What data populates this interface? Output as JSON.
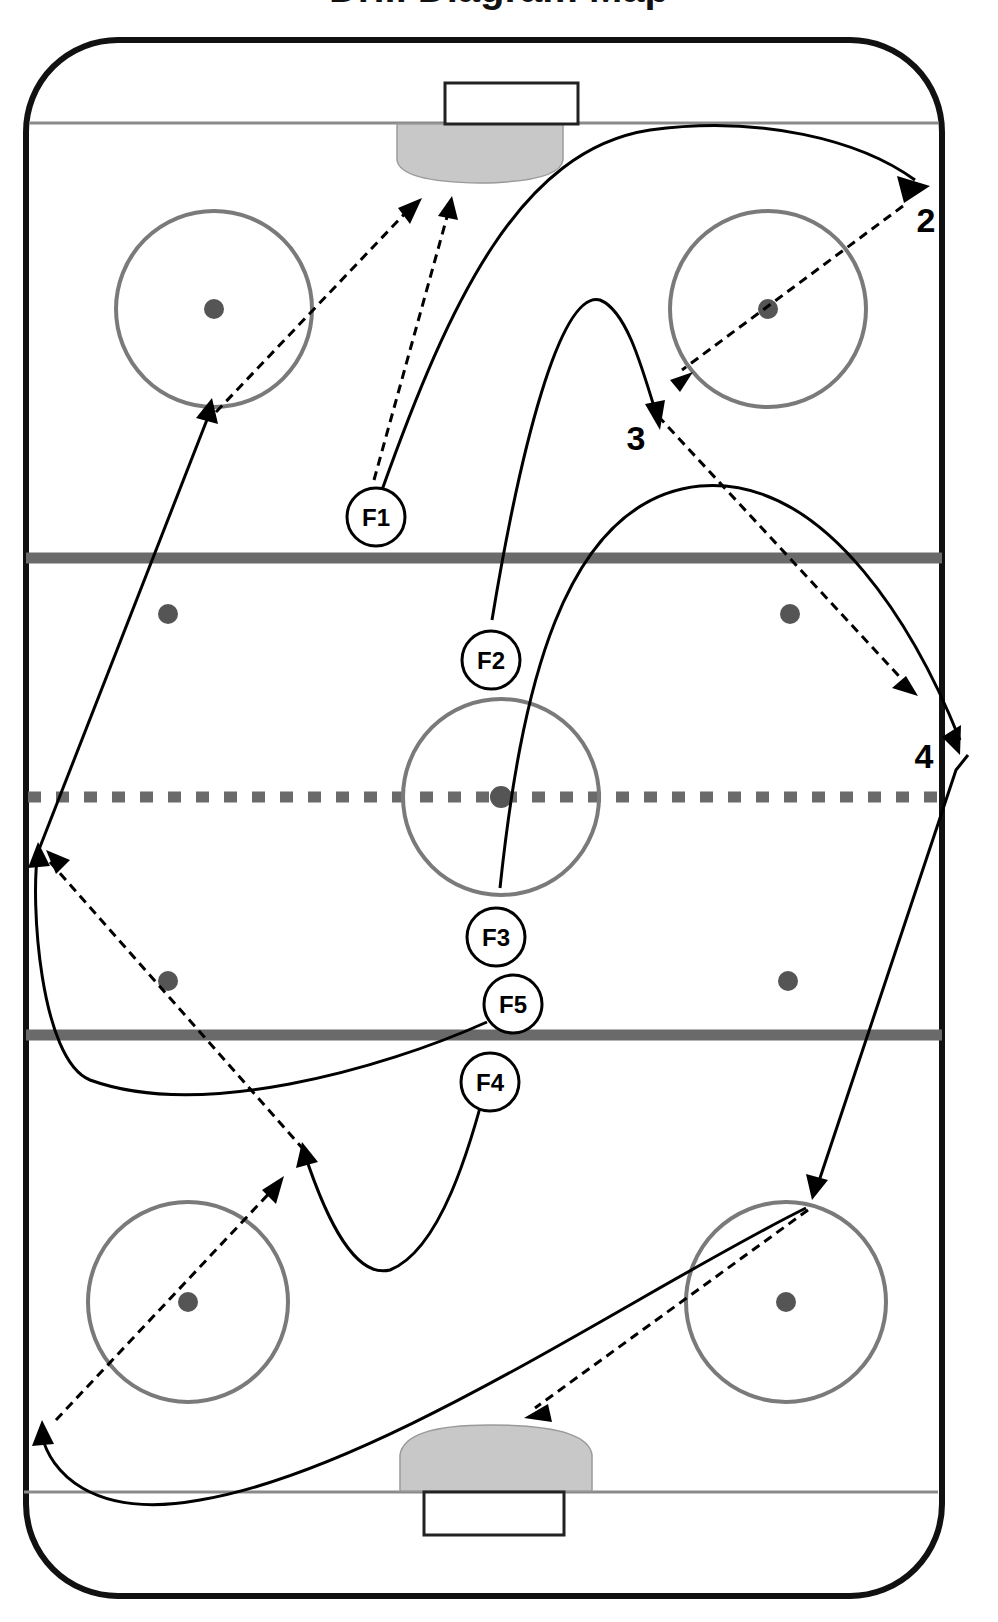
{
  "title": "Drill Diagram Map",
  "colors": {
    "board": "#111111",
    "redline_blue": "#6a6a6a",
    "goal_line": "#8a8a8a",
    "crease": "#c8c8c8",
    "circle": "#7a7a7a",
    "dot": "#555555",
    "path": "#000000"
  },
  "players": [
    {
      "id": "F1",
      "label": "F1",
      "x": 364,
      "y": 498
    },
    {
      "id": "F2",
      "label": "F2",
      "x": 475,
      "y": 640
    },
    {
      "id": "F3",
      "label": "F3",
      "x": 480,
      "y": 906
    },
    {
      "id": "F5",
      "label": "F5",
      "x": 496,
      "y": 972
    },
    {
      "id": "F4",
      "label": "F4",
      "x": 474,
      "y": 1046
    }
  ],
  "waypoints": [
    {
      "id": "2",
      "label": "2",
      "x": 895,
      "y": 214
    },
    {
      "id": "3",
      "label": "3",
      "x": 614,
      "y": 426
    },
    {
      "id": "4",
      "label": "4",
      "x": 893,
      "y": 732
    }
  ],
  "legend": {
    "solid_line": "skate path",
    "dashed_line": "pass"
  },
  "rink": {
    "zones": [
      "offensive-zone",
      "neutral-zone",
      "defensive-zone"
    ],
    "faceoff_circles": 5,
    "faceoff_dots": 9
  }
}
